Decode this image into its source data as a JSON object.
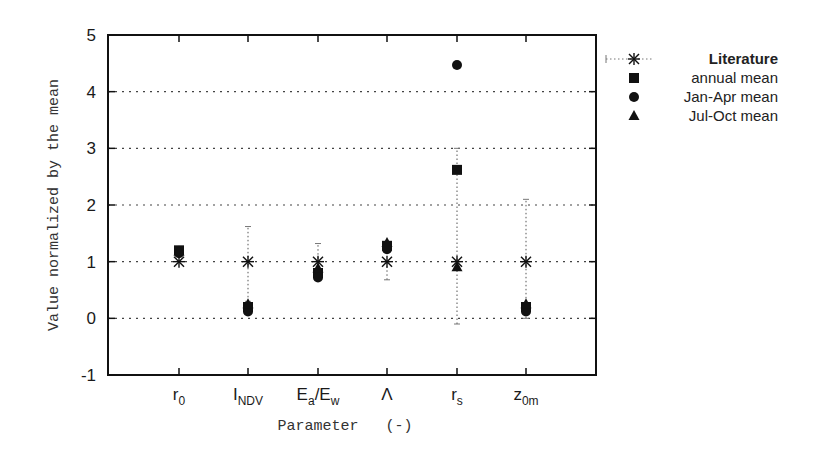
{
  "chart_data": {
    "type": "scatter",
    "title": "",
    "xlabel": "Parameter   (-)",
    "ylabel": "Value normalized by the mean",
    "ylim": [
      -1,
      5
    ],
    "yticks": [
      -1,
      0,
      1,
      2,
      3,
      4,
      5
    ],
    "grid": "horizontal dotted at y = 0,1,2,3,4",
    "legend_position": "outside right, top",
    "categories": [
      {
        "main": "r",
        "sub": "0"
      },
      {
        "main": "I",
        "sub": "NDV"
      },
      {
        "main": "E",
        "sub": "a",
        "main2": "/E",
        "sub2": "w"
      },
      {
        "main": "Λ",
        "sub": ""
      },
      {
        "main": "r",
        "sub": "s"
      },
      {
        "main": "z",
        "sub": "0m"
      }
    ],
    "category_names": [
      "r0",
      "I_NDV",
      "Ea/Ew",
      "Lambda",
      "rs",
      "z0m"
    ],
    "series": [
      {
        "name": "Literature",
        "marker": "asterisk",
        "values": [
          1.0,
          1.0,
          1.0,
          1.0,
          1.0,
          1.0
        ],
        "error_low": [
          1.0,
          0.3,
          0.7,
          0.68,
          -0.1,
          0.0
        ],
        "error_high": [
          1.0,
          1.62,
          1.32,
          1.0,
          3.0,
          2.1
        ]
      },
      {
        "name": "annual mean",
        "marker": "square",
        "values": [
          1.2,
          0.2,
          0.8,
          1.28,
          2.62,
          0.2
        ]
      },
      {
        "name": "Jan-Apr mean",
        "marker": "circle",
        "values": [
          1.15,
          0.12,
          0.72,
          1.22,
          4.47,
          0.12
        ]
      },
      {
        "name": "Jul-Oct mean",
        "marker": "triangle",
        "values": [
          1.18,
          0.25,
          0.88,
          1.33,
          0.9,
          0.25
        ]
      }
    ]
  },
  "axes": {
    "ylabel": "Value normalized by the mean",
    "xlabel": "Parameter   (-)",
    "yticks": [
      "-1",
      "0",
      "1",
      "2",
      "3",
      "4",
      "5"
    ]
  },
  "legend": {
    "items": [
      {
        "label": "Literature",
        "marker": "asterisk"
      },
      {
        "label": "annual mean",
        "marker": "square"
      },
      {
        "label": "Jan-Apr mean",
        "marker": "circle"
      },
      {
        "label": "Jul-Oct mean",
        "marker": "triangle"
      }
    ]
  },
  "colors": {
    "ink": "#111111",
    "grid": "#555555",
    "background": "#ffffff"
  }
}
